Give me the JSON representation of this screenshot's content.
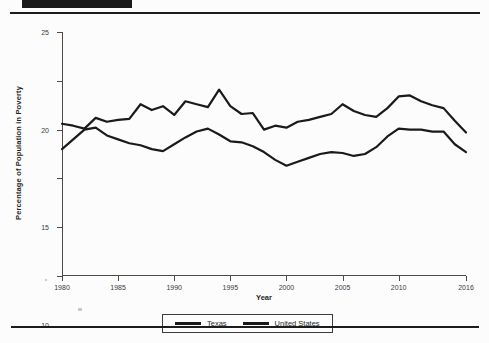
{
  "page": {
    "background_color": "#fcfcfd",
    "rule_color": "#1c1c1c",
    "header_bar_color": "#1a1a1a"
  },
  "chart_data": {
    "type": "line",
    "title": "",
    "xlabel": "Year",
    "ylabel": "Percentage of Population in Poverty",
    "xlim": [
      1980,
      2016
    ],
    "ylim": [
      0,
      25
    ],
    "ytick_labels": [
      "0",
      "5",
      "10",
      "15",
      "20",
      "25"
    ],
    "yticks": [
      0,
      5,
      10,
      15,
      20,
      25
    ],
    "xtick_labels": [
      "1980",
      "1985",
      "1990",
      "1995",
      "2000",
      "2005",
      "2010",
      "2016"
    ],
    "xticks": [
      1980,
      1985,
      1990,
      1995,
      2000,
      2005,
      2010,
      2016
    ],
    "grid": false,
    "legend_position": "bottom-center",
    "line_color": "#1a1a1a",
    "x": [
      1980,
      1981,
      1982,
      1983,
      1984,
      1985,
      1986,
      1987,
      1988,
      1989,
      1990,
      1991,
      1992,
      1993,
      1994,
      1995,
      1996,
      1997,
      1998,
      1999,
      2000,
      2001,
      2002,
      2003,
      2004,
      2005,
      2006,
      2007,
      2008,
      2009,
      2010,
      2011,
      2012,
      2013,
      2014,
      2015,
      2016
    ],
    "series": [
      {
        "name": "Texas",
        "color": "#1a1a1a",
        "values": [
          15.6,
          15.4,
          15.1,
          16.2,
          15.8,
          16.0,
          16.1,
          17.6,
          17.0,
          17.4,
          16.5,
          17.9,
          17.6,
          17.3,
          19.1,
          17.4,
          16.6,
          16.7,
          15.0,
          15.4,
          15.2,
          15.8,
          16.0,
          16.3,
          16.6,
          17.6,
          16.9,
          16.5,
          16.3,
          17.2,
          18.4,
          18.5,
          17.9,
          17.5,
          17.2,
          15.9,
          14.7
        ]
      },
      {
        "name": "United States",
        "color": "#1a1a1a",
        "values": [
          13.0,
          14.0,
          15.0,
          15.2,
          14.4,
          14.0,
          13.6,
          13.4,
          13.0,
          12.8,
          13.5,
          14.2,
          14.8,
          15.1,
          14.5,
          13.8,
          13.7,
          13.3,
          12.7,
          11.9,
          11.3,
          11.7,
          12.1,
          12.5,
          12.7,
          12.6,
          12.3,
          12.5,
          13.2,
          14.3,
          15.1,
          15.0,
          15.0,
          14.8,
          14.8,
          13.5,
          12.7
        ]
      }
    ]
  },
  "legend": {
    "items": [
      {
        "label": "Texas"
      },
      {
        "label": "United States"
      }
    ]
  }
}
